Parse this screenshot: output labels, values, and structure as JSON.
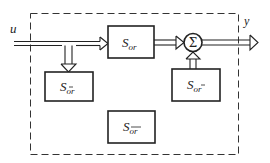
{
  "diagram": {
    "input_label": "u",
    "output_label": "y",
    "sum_symbol": "Σ",
    "blocks": [
      {
        "id": "s_or",
        "main": "S",
        "sub": "or",
        "sub_bar_o": false,
        "sub_bar_r": false
      },
      {
        "id": "s_obar_r",
        "main": "S",
        "sub": "ōr",
        "sub_bar_o": true,
        "sub_bar_r": false
      },
      {
        "id": "s_o_rbar",
        "main": "S",
        "sub": "or̄",
        "sub_bar_o": false,
        "sub_bar_r": true
      },
      {
        "id": "s_obar_rbar",
        "main": "S",
        "sub": "ōr̄",
        "sub_bar_o": true,
        "sub_bar_r": true
      }
    ],
    "colors": {
      "stroke": "#222222",
      "background": "#ffffff"
    }
  }
}
